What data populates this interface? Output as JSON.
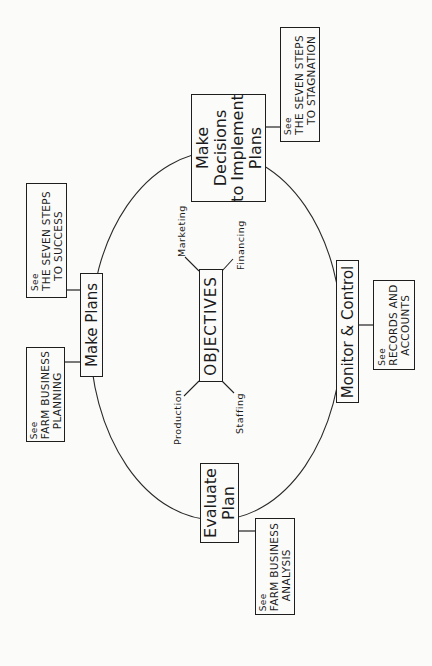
{
  "diagram": {
    "center": {
      "label": "OBJECTIVES",
      "aspects": [
        "Marketing",
        "Financing",
        "Production",
        "Staffing"
      ]
    },
    "stages": [
      {
        "id": "make-plans",
        "lines": [
          "Make Plans"
        ]
      },
      {
        "id": "make-decisions",
        "lines": [
          "Make",
          "Decisions",
          "to Implement",
          "Plans"
        ]
      },
      {
        "id": "monitor-control",
        "lines": [
          "Monitor & Control"
        ]
      },
      {
        "id": "evaluate-plan",
        "lines": [
          "Evaluate",
          "Plan"
        ]
      }
    ],
    "references": [
      {
        "stage": "make-plans",
        "see": "See",
        "lines": [
          "THE SEVEN STEPS",
          "TO SUCCESS"
        ]
      },
      {
        "stage": "make-plans",
        "see": "See",
        "lines": [
          "FARM BUSINESS",
          "PLANNING"
        ]
      },
      {
        "stage": "make-decisions",
        "see": "See",
        "lines": [
          "THE SEVEN STEPS",
          "TO STAGNATION"
        ]
      },
      {
        "stage": "monitor-control",
        "see": "See",
        "lines": [
          "RECORDS AND",
          "ACCOUNTS"
        ]
      },
      {
        "stage": "evaluate-plan",
        "see": "See",
        "lines": [
          "FARM BUSINESS",
          "ANALYSIS"
        ]
      }
    ],
    "orientation": "rotated 90 degrees counter-clockwise",
    "colors": {
      "ink": "#1e1e1e",
      "paper": "#fbfbfa"
    }
  }
}
